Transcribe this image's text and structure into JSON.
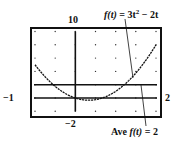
{
  "chart_data": {
    "type": "line",
    "title": "",
    "style": "graphing-calculator screen",
    "window": {
      "xmin": -1,
      "xmax": 2,
      "xscl": 0.5,
      "ymin": -2,
      "ymax": 10,
      "yscl": 2
    },
    "grid": true,
    "series": [
      {
        "name": "f(t) = 3t^2 - 2t",
        "expression": "3t^2 - 2t",
        "x": [
          -1,
          -0.5,
          0,
          0.3333,
          0.5,
          1,
          1.5,
          2
        ],
        "values": [
          5,
          1.75,
          0,
          -0.3333,
          -0.25,
          1,
          3.75,
          8
        ]
      },
      {
        "name": "Ave f(t) = 2",
        "expression": "2",
        "x": [
          -1,
          2
        ],
        "values": [
          2,
          2
        ]
      }
    ],
    "annotations": [
      {
        "text": "f(t) = 3t² − 2t",
        "points_to": "parabola"
      },
      {
        "text": "Ave f(t) = 2",
        "points_to": "horizontal line y = 2"
      }
    ],
    "tick_labels": {
      "x_left": "−1",
      "x_right": "2",
      "y_top": "10",
      "y_bottom": "−2"
    }
  },
  "labels": {
    "equation_prefix": "f(t)",
    "equation_rest": " = 3t",
    "equation_sup": "2",
    "equation_tail": " − 2t",
    "ave_prefix": "Ave ",
    "ave_func": "f(t)",
    "ave_rest": " = 2",
    "xmin": "−1",
    "xmax": "2",
    "ymax": "10",
    "ymin": "−2"
  },
  "colors": {
    "ink": "#111111",
    "background": "#ffffff",
    "grid_dot": "#333333"
  }
}
